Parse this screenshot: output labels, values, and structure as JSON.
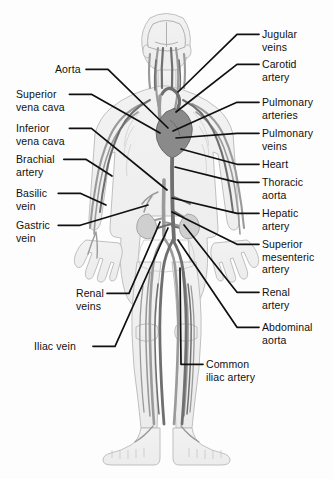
{
  "figure": {
    "width": 333,
    "height": 479,
    "background_color": "#fdfdfd",
    "line_color": "#101010",
    "text_color": "#101010",
    "artery_color": "#6e6e6e",
    "vein_color": "#8e8e8e",
    "body_outline_color": "#b9b9b9"
  },
  "labels": {
    "aorta": "Aorta",
    "superior_vena_cava": "Superior\nvena cava",
    "inferior_vena_cava": "Inferior\nvena cava",
    "brachial_artery": "Brachial\nartery",
    "basilic_vein": "Basilic\nvein",
    "gastric_vein": "Gastric\nvein",
    "renal_veins": "Renal\nveins",
    "iliac_vein": "Iliac vein",
    "jugular_veins": "Jugular\nveins",
    "carotid_artery": "Carotid\nartery",
    "pulmonary_arteries": "Pulmonary\narteries",
    "pulmonary_veins": "Pulmonary\nveins",
    "heart": "Heart",
    "thoracic_aorta": "Thoracic\naorta",
    "hepatic_artery": "Hepatic\nartery",
    "superior_mesenteric_artery": "Superior\nmesenteric\nartery",
    "renal_artery": "Renal\nartery",
    "abdominal_aorta": "Abdominal\naorta",
    "common_iliac_artery": "Common\niliac artery"
  },
  "callouts": [
    {
      "id": "aorta",
      "side": "left",
      "text_x": 55,
      "text_y": 63,
      "anchor_x": 168,
      "anchor_y": 128
    },
    {
      "id": "superior_vena_cava",
      "side": "left",
      "text_x": 16,
      "text_y": 88,
      "anchor_x": 160,
      "anchor_y": 133
    },
    {
      "id": "inferior_vena_cava",
      "side": "left",
      "text_x": 16,
      "text_y": 122,
      "anchor_x": 167,
      "anchor_y": 190
    },
    {
      "id": "brachial_artery",
      "side": "left",
      "text_x": 16,
      "text_y": 153,
      "anchor_x": 112,
      "anchor_y": 176
    },
    {
      "id": "basilic_vein",
      "side": "left",
      "text_x": 16,
      "text_y": 187,
      "anchor_x": 106,
      "anchor_y": 205
    },
    {
      "id": "gastric_vein",
      "side": "left",
      "text_x": 16,
      "text_y": 219,
      "anchor_x": 148,
      "anchor_y": 205
    },
    {
      "id": "renal_veins",
      "side": "left",
      "text_x": 76,
      "text_y": 287,
      "anchor_x": 160,
      "anchor_y": 222
    },
    {
      "id": "iliac_vein",
      "side": "left",
      "text_x": 34,
      "text_y": 340,
      "anchor_x": 168,
      "anchor_y": 228
    },
    {
      "id": "jugular_veins",
      "side": "right",
      "text_x": 262,
      "text_y": 28,
      "anchor_x": 178,
      "anchor_y": 92
    },
    {
      "id": "carotid_artery",
      "side": "right",
      "text_x": 262,
      "text_y": 58,
      "anchor_x": 176,
      "anchor_y": 112
    },
    {
      "id": "pulmonary_arteries",
      "side": "right",
      "text_x": 262,
      "text_y": 96,
      "anchor_x": 173,
      "anchor_y": 131
    },
    {
      "id": "pulmonary_veins",
      "side": "right",
      "text_x": 262,
      "text_y": 127,
      "anchor_x": 176,
      "anchor_y": 138
    },
    {
      "id": "heart",
      "side": "right",
      "text_x": 262,
      "text_y": 158,
      "anchor_x": 181,
      "anchor_y": 149
    },
    {
      "id": "thoracic_aorta",
      "side": "right",
      "text_x": 262,
      "text_y": 176,
      "anchor_x": 175,
      "anchor_y": 167
    },
    {
      "id": "hepatic_artery",
      "side": "right",
      "text_x": 262,
      "text_y": 207,
      "anchor_x": 172,
      "anchor_y": 198
    },
    {
      "id": "superior_mesenteric_artery",
      "side": "right",
      "text_x": 262,
      "text_y": 238,
      "anchor_x": 172,
      "anchor_y": 212
    },
    {
      "id": "renal_artery",
      "side": "right",
      "text_x": 262,
      "text_y": 286,
      "anchor_x": 184,
      "anchor_y": 225
    },
    {
      "id": "abdominal_aorta",
      "side": "right",
      "text_x": 262,
      "text_y": 321,
      "anchor_x": 178,
      "anchor_y": 240
    },
    {
      "id": "common_iliac_artery",
      "side": "right",
      "text_x": 206,
      "text_y": 358,
      "anchor_x": 180,
      "anchor_y": 268
    }
  ]
}
